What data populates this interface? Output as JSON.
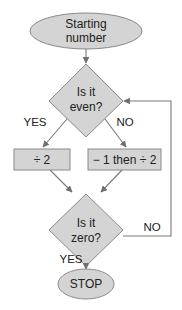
{
  "flowchart": {
    "start": {
      "line1": "Starting",
      "line2": "number"
    },
    "decision_even": {
      "line1": "Is it",
      "line2": "even?"
    },
    "even_yes_label": "YES",
    "even_no_label": "NO",
    "process_divide": {
      "label": "÷ 2"
    },
    "process_minus_divide": {
      "label": "− 1 then ÷ 2"
    },
    "decision_zero": {
      "line1": "Is it",
      "line2": "zero?"
    },
    "zero_no_label": "NO",
    "zero_yes_label": "YES",
    "stop": {
      "label": "STOP"
    }
  },
  "colors": {
    "shape_fill": "#d4d4d4",
    "shape_stroke": "#8a8a8a",
    "line": "#7a7a7a",
    "text": "#222222"
  }
}
